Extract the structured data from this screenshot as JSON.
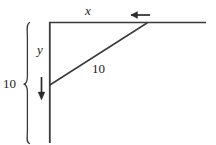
{
  "figure": {
    "domain": "Diagram",
    "canvas": {
      "width": 216,
      "height": 145,
      "background": "#ffffff"
    },
    "stroke_color": "#3a3a3a",
    "label_color": "#1a1a1a",
    "labels": {
      "horizontal_leg": "x",
      "vertical_leg": "y",
      "hypotenuse_length": "10",
      "total_height": "10"
    },
    "icons": {
      "motion_arrow_left": "arrow-left-icon",
      "motion_arrow_down": "arrow-down-icon",
      "measure_brace": "curly-brace-icon"
    },
    "geometry": {
      "corner": {
        "x": 49,
        "y": 22
      },
      "horizontal_line_end": {
        "x": 206,
        "y": 22
      },
      "vertical_line_end": {
        "x": 49,
        "y": 143
      },
      "diagonal_top": {
        "x": 147,
        "y": 23
      },
      "diagonal_bottom": {
        "x": 49,
        "y": 85
      },
      "arrow_left": {
        "from_x": 150,
        "to_x": 128,
        "y": 15
      },
      "arrow_down": {
        "x": 41,
        "from_y": 78,
        "to_y": 99
      },
      "brace": {
        "x": 25,
        "top_y": 22,
        "bottom_y": 143,
        "point_y": 84
      }
    }
  }
}
